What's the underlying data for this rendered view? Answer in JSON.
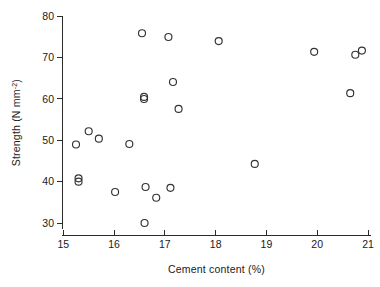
{
  "chart_data": {
    "type": "scatter",
    "title": "",
    "xlabel": "Cement content (%)",
    "ylabel": "Strength (N mm⁻²)",
    "ylabel_parts": {
      "main": "Strength (N mm",
      "superscript": "-2",
      "tail": ")"
    },
    "xlim": [
      15,
      21
    ],
    "ylim": [
      30,
      80
    ],
    "xticks": [
      15,
      16,
      17,
      18,
      19,
      20,
      21
    ],
    "yticks": [
      30,
      40,
      50,
      60,
      70,
      80
    ],
    "xtick_labels": [
      "15",
      "16",
      "17",
      "18",
      "19",
      "20",
      "21"
    ],
    "ytick_labels": [
      "30",
      "40",
      "50",
      "60",
      "70",
      "80"
    ],
    "grid": false,
    "legend": false,
    "marker": "open-circle",
    "marker_color": "#333333",
    "n_points": 22,
    "x": [
      15.25,
      15.5,
      15.7,
      15.3,
      15.3,
      16.02,
      16.3,
      16.55,
      16.59,
      16.59,
      16.6,
      16.62,
      16.83,
      17.07,
      17.11,
      17.16,
      17.27,
      18.06,
      18.77,
      19.94,
      20.65,
      20.75,
      20.88
    ],
    "y": [
      49.0,
      52.2,
      50.4,
      40.8,
      40.0,
      37.5,
      49.1,
      75.9,
      60.5,
      60.0,
      30.0,
      38.7,
      36.1,
      75.0,
      38.5,
      64.1,
      57.6,
      74.0,
      44.3,
      71.4,
      61.4,
      70.7,
      71.7
    ],
    "points": [
      {
        "x": 15.25,
        "y": 49.0
      },
      {
        "x": 15.5,
        "y": 52.2
      },
      {
        "x": 15.7,
        "y": 50.4
      },
      {
        "x": 15.3,
        "y": 40.8
      },
      {
        "x": 15.3,
        "y": 40.0
      },
      {
        "x": 16.02,
        "y": 37.5
      },
      {
        "x": 16.3,
        "y": 49.1
      },
      {
        "x": 16.55,
        "y": 75.9
      },
      {
        "x": 16.59,
        "y": 60.5
      },
      {
        "x": 16.59,
        "y": 60.0
      },
      {
        "x": 16.6,
        "y": 30.0
      },
      {
        "x": 16.62,
        "y": 38.7
      },
      {
        "x": 16.83,
        "y": 36.1
      },
      {
        "x": 17.07,
        "y": 75.0
      },
      {
        "x": 17.11,
        "y": 38.5
      },
      {
        "x": 17.16,
        "y": 64.1
      },
      {
        "x": 17.27,
        "y": 57.6
      },
      {
        "x": 18.06,
        "y": 74.0
      },
      {
        "x": 18.77,
        "y": 44.3
      },
      {
        "x": 19.94,
        "y": 71.4
      },
      {
        "x": 20.65,
        "y": 61.4
      },
      {
        "x": 20.75,
        "y": 70.7
      },
      {
        "x": 20.88,
        "y": 71.7
      }
    ]
  }
}
